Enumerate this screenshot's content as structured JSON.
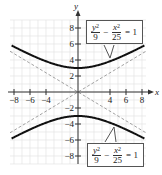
{
  "chart_data": {
    "type": "line",
    "title": "",
    "xlabel": "x",
    "ylabel": "y",
    "xlim": [
      -8.5,
      8.5
    ],
    "ylim": [
      -9,
      9
    ],
    "grid": true,
    "x_ticks": [
      -8,
      -6,
      -4,
      4,
      6,
      8
    ],
    "y_ticks": [
      8,
      6,
      4,
      2,
      -2,
      -4,
      -6,
      -8
    ],
    "x_tick_labels": [
      "−8",
      "−6",
      "−4",
      "4",
      "6",
      "8"
    ],
    "y_tick_labels": [
      "8",
      "6",
      "4",
      "2",
      "−2",
      "−4",
      "−6",
      "−8"
    ],
    "series": [
      {
        "name": "upper branch",
        "equation": "y²/9 − x²/25 = 1",
        "style": "solid",
        "color": "#111111",
        "x": [
          -8,
          -6,
          -4,
          -2,
          0,
          2,
          4,
          6,
          8
        ],
        "y": [
          5.66,
          4.69,
          3.84,
          3.23,
          3.0,
          3.23,
          3.84,
          4.69,
          5.66
        ]
      },
      {
        "name": "lower branch",
        "equation": "y²/9 − x²/25 = 1",
        "style": "solid",
        "color": "#111111",
        "x": [
          -8,
          -6,
          -4,
          -2,
          0,
          2,
          4,
          6,
          8
        ],
        "y": [
          -5.66,
          -4.69,
          -3.84,
          -3.23,
          -3.0,
          -3.23,
          -3.84,
          -4.69,
          -5.66
        ]
      },
      {
        "name": "asymptote y = 3x/5",
        "style": "dashed",
        "color": "#999999",
        "x": [
          -8.5,
          8.5
        ],
        "y": [
          -5.1,
          5.1
        ]
      },
      {
        "name": "asymptote y = −3x/5",
        "style": "dashed",
        "color": "#999999",
        "x": [
          -8.5,
          8.5
        ],
        "y": [
          5.1,
          -5.1
        ]
      }
    ],
    "annotations": [
      {
        "text": "y²/9 − x²/25 = 1",
        "position": "top-right",
        "points_to": "upper branch"
      },
      {
        "text": "y²/9 − x²/25 = 1",
        "position": "bottom-right",
        "points_to": "lower branch"
      }
    ]
  },
  "labels": {
    "x_axis": "x",
    "y_axis": "y",
    "eq_top": {
      "y_num": "y",
      "y_exp": "2",
      "y_den": "9",
      "minus": "−",
      "x_num": "x",
      "x_exp": "2",
      "x_den": "25",
      "rhs": "= 1"
    },
    "eq_bottom": {
      "y_num": "y",
      "y_exp": "2",
      "y_den": "9",
      "minus": "−",
      "x_num": "x",
      "x_exp": "2",
      "x_den": "25",
      "rhs": "= 1"
    }
  }
}
